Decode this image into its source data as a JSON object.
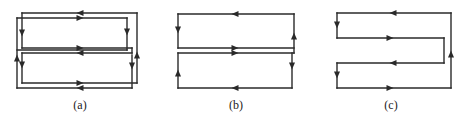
{
  "colors": {
    "line": "#2a2a2a",
    "background": "#ffffff"
  },
  "diagrams": [
    {
      "id": "a",
      "label": "(a)",
      "label_x": 80,
      "description": "Two interleaved rectangular loops forming a double serpentine path",
      "segments": [
        [
          22,
          13,
          137,
          13
        ],
        [
          22,
          13,
          22,
          48
        ],
        [
          22,
          48,
          132,
          48
        ],
        [
          132,
          48,
          132,
          53
        ],
        [
          22,
          53,
          132,
          53
        ],
        [
          22,
          53,
          22,
          83
        ],
        [
          22,
          83,
          137,
          83
        ],
        [
          137,
          13,
          137,
          83
        ],
        [
          17,
          18,
          127,
          18
        ],
        [
          127,
          18,
          127,
          50
        ],
        [
          127,
          50,
          17,
          50
        ],
        [
          17,
          18,
          17,
          88
        ],
        [
          17,
          88,
          132,
          88
        ],
        [
          132,
          55,
          132,
          88
        ]
      ],
      "arrows": [
        {
          "x": 80,
          "y": 13,
          "dir": "left"
        },
        {
          "x": 80,
          "y": 18,
          "dir": "right"
        },
        {
          "x": 80,
          "y": 48,
          "dir": "right"
        },
        {
          "x": 80,
          "y": 53,
          "dir": "left"
        },
        {
          "x": 80,
          "y": 83,
          "dir": "right"
        },
        {
          "x": 80,
          "y": 88,
          "dir": "left"
        },
        {
          "x": 22,
          "y": 33,
          "dir": "down"
        },
        {
          "x": 17,
          "y": 58,
          "dir": "up"
        },
        {
          "x": 22,
          "y": 65,
          "dir": "down"
        },
        {
          "x": 127,
          "y": 32,
          "dir": "down"
        },
        {
          "x": 137,
          "y": 55,
          "dir": "up"
        },
        {
          "x": 132,
          "y": 66,
          "dir": "down"
        }
      ]
    },
    {
      "id": "b",
      "label": "(b)",
      "label_x": 236,
      "description": "Two stacked rectangular loops joined at the middle",
      "segments": [
        [
          178,
          14,
          294,
          14
        ],
        [
          178,
          14,
          178,
          48
        ],
        [
          178,
          48,
          294,
          48
        ],
        [
          294,
          14,
          294,
          53
        ],
        [
          178,
          53,
          294,
          53
        ],
        [
          178,
          53,
          178,
          88
        ],
        [
          178,
          88,
          292,
          88
        ],
        [
          292,
          53,
          292,
          88
        ]
      ],
      "arrows": [
        {
          "x": 235,
          "y": 14,
          "dir": "left"
        },
        {
          "x": 235,
          "y": 48,
          "dir": "right"
        },
        {
          "x": 235,
          "y": 53,
          "dir": "right"
        },
        {
          "x": 235,
          "y": 88,
          "dir": "left"
        },
        {
          "x": 178,
          "y": 30,
          "dir": "down"
        },
        {
          "x": 178,
          "y": 73,
          "dir": "up"
        },
        {
          "x": 294,
          "y": 36,
          "dir": "up"
        },
        {
          "x": 292,
          "y": 66,
          "dir": "down"
        }
      ]
    },
    {
      "id": "c",
      "label": "(c)",
      "label_x": 391,
      "description": "Single serpentine path with outer return",
      "segments": [
        [
          337,
          13,
          451,
          13
        ],
        [
          337,
          13,
          337,
          38
        ],
        [
          337,
          38,
          444,
          38
        ],
        [
          444,
          38,
          444,
          63
        ],
        [
          337,
          63,
          444,
          63
        ],
        [
          337,
          63,
          337,
          88
        ],
        [
          337,
          88,
          451,
          88
        ],
        [
          451,
          13,
          451,
          88
        ]
      ],
      "arrows": [
        {
          "x": 393,
          "y": 13,
          "dir": "left"
        },
        {
          "x": 390,
          "y": 38,
          "dir": "right"
        },
        {
          "x": 393,
          "y": 63,
          "dir": "left"
        },
        {
          "x": 390,
          "y": 88,
          "dir": "right"
        },
        {
          "x": 337,
          "y": 25,
          "dir": "down"
        },
        {
          "x": 337,
          "y": 75,
          "dir": "down"
        },
        {
          "x": 451,
          "y": 54,
          "dir": "up"
        }
      ]
    }
  ]
}
